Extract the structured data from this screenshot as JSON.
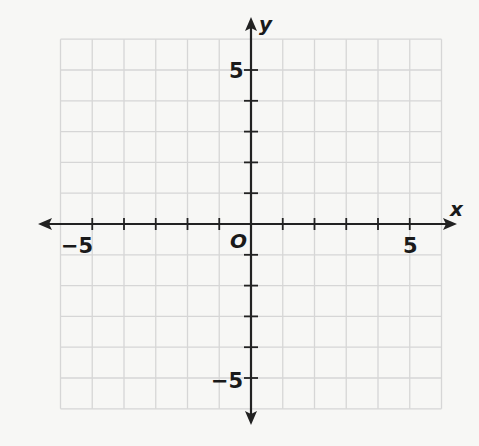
{
  "graph": {
    "type": "coordinate-plane",
    "x_axis_label": "x",
    "y_axis_label": "y",
    "origin_label": "O",
    "x_range": [
      -6,
      6
    ],
    "y_range": [
      -6,
      6
    ],
    "grid_step": 1,
    "tick_labels": {
      "x_neg": "−5",
      "x_pos": "5",
      "y_pos": "5",
      "y_neg": "−5"
    },
    "colors": {
      "grid": "#d6d6d6",
      "axis": "#222222",
      "background": "#f7f7f5"
    }
  }
}
